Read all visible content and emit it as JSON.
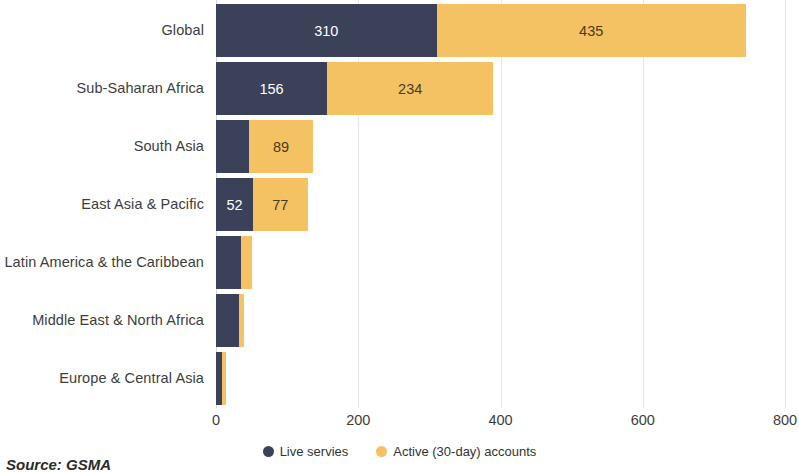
{
  "chart_data": {
    "type": "bar",
    "orientation": "horizontal",
    "stacked": true,
    "title": "",
    "xlabel": "",
    "ylabel": "",
    "xlim": [
      0,
      800
    ],
    "xticks": [
      "0",
      "200",
      "400",
      "600",
      "800"
    ],
    "grid": "vertical",
    "legend_position": "bottom-center",
    "categories": [
      "Global",
      "Sub-Saharan Africa",
      "South Asia",
      "East Asia & Pacific",
      "Latin America & the Caribbean",
      "Middle East & North Africa",
      "Europe & Central Asia"
    ],
    "series": [
      {
        "name": "Live servies",
        "color": "#3a4158",
        "values": [
          310,
          156,
          47,
          52,
          35,
          33,
          8
        ],
        "labels": [
          "310",
          "156",
          "",
          "52",
          "",
          "",
          ""
        ]
      },
      {
        "name": "Active (30-day) accounts",
        "color": "#f5c263",
        "values": [
          435,
          234,
          89,
          77,
          15,
          7,
          6
        ],
        "labels": [
          "435",
          "234",
          "89",
          "77",
          "",
          "",
          ""
        ]
      }
    ]
  },
  "legend": {
    "items": [
      {
        "label": "Live servies",
        "color": "#3a4158"
      },
      {
        "label": "Active (30-day) accounts",
        "color": "#f5c263"
      }
    ]
  },
  "source_note": "Source: GSMA"
}
